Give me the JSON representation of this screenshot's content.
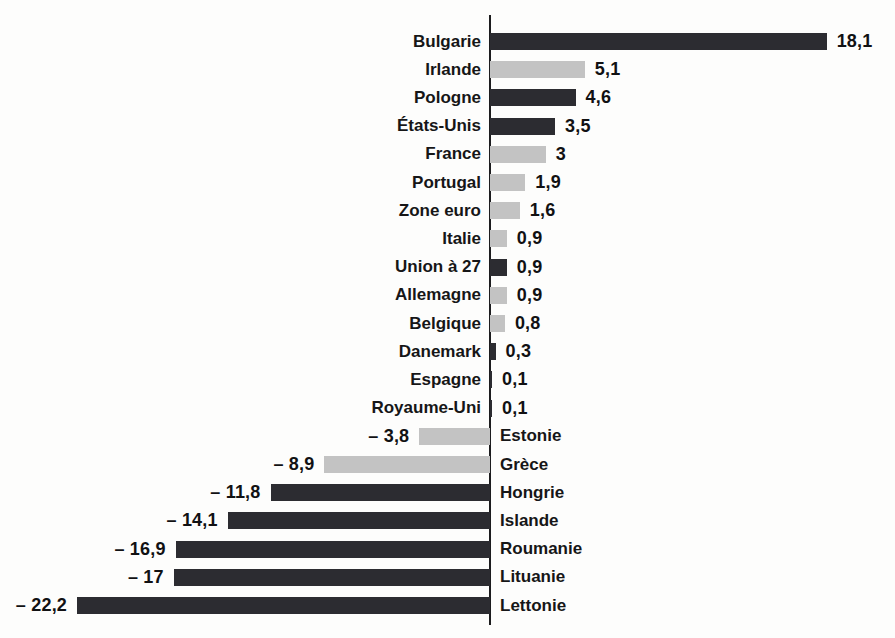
{
  "chart_data": {
    "type": "bar",
    "orientation": "horizontal-diverging",
    "title": "",
    "xlabel": "",
    "ylabel": "",
    "legend": "none",
    "grid": false,
    "xlim": [
      -24.5,
      21.5
    ],
    "baseline": 0,
    "number_format": "french-comma",
    "categories": [
      "Bulgarie",
      "Irlande",
      "Pologne",
      "États-Unis",
      "France",
      "Portugal",
      "Zone euro",
      "Italie",
      "Union à 27",
      "Allemagne",
      "Belgique",
      "Danemark",
      "Espagne",
      "Royaume-Uni",
      "Estonie",
      "Grèce",
      "Hongrie",
      "Islande",
      "Roumanie",
      "Lituanie",
      "Lettonie"
    ],
    "values": [
      18.1,
      5.1,
      4.6,
      3.5,
      3,
      1.9,
      1.6,
      0.9,
      0.9,
      0.9,
      0.8,
      0.3,
      0.1,
      0.1,
      -3.8,
      -8.9,
      -11.8,
      -14.1,
      -16.9,
      -17,
      -22.2
    ],
    "value_labels": [
      "18,1",
      "5,1",
      "4,6",
      "3,5",
      "3",
      "1,9",
      "1,6",
      "0,9",
      "0,9",
      "0,9",
      "0,8",
      "0,3",
      "0,1",
      "0,1",
      "– 3,8",
      "– 8,9",
      "– 11,8",
      "– 14,1",
      "– 16,9",
      "– 17",
      "– 22,2"
    ],
    "bar_tones": [
      "dark",
      "light",
      "dark",
      "dark",
      "light",
      "light",
      "light",
      "light",
      "dark",
      "light",
      "light",
      "dark",
      "dark",
      "dark",
      "light",
      "light",
      "dark",
      "dark",
      "dark",
      "dark",
      "dark"
    ],
    "palette": {
      "dark": "#2c2c31",
      "light": "#c3c3c3"
    },
    "axis_color": "#1c1c1e",
    "text_color": "#161617"
  }
}
